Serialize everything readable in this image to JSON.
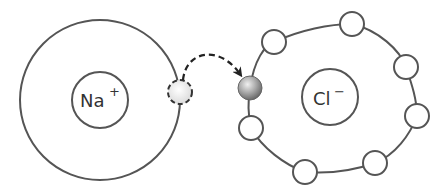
{
  "diagram": {
    "type": "ionic-bond-electron-transfer",
    "sodium": {
      "symbol": "Na",
      "charge": "+",
      "center": [
        100,
        100
      ],
      "shell_radius": 80,
      "nucleus_radius": 28,
      "departing_electron": {
        "position": [
          180,
          92
        ],
        "style": "dashed"
      }
    },
    "chlorine": {
      "symbol": "Cl",
      "charge": "−",
      "center": [
        332,
        100
      ],
      "shell_radius": 82,
      "nucleus_radius": 28,
      "gained_electron": {
        "position": [
          250,
          88
        ],
        "style": "solid-grey"
      },
      "electron_count": 8
    },
    "arrow": {
      "style": "dashed-curved",
      "from": [
        182,
        80
      ],
      "to": [
        243,
        78
      ]
    },
    "colors": {
      "line": "#555555",
      "electron_gained": "#a0a0a0",
      "electron_transferred": "#e8e8e8",
      "background": "#ffffff"
    }
  }
}
